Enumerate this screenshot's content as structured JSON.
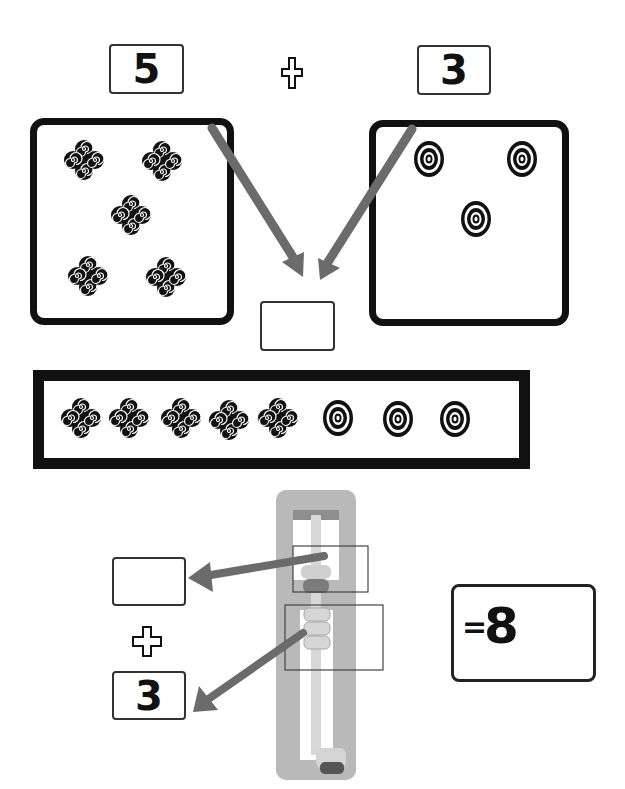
{
  "worksheet": {
    "heading_partial": "",
    "top_equation": {
      "left_number": "5",
      "operator": "plus",
      "right_number": "3"
    },
    "left_group": {
      "item_icon": "swirl-cluster-icon",
      "count": 5
    },
    "right_group": {
      "item_icon": "concentric-oval-icon",
      "count": 3
    },
    "combined_row": {
      "items": [
        "swirl-cluster-icon",
        "swirl-cluster-icon",
        "swirl-cluster-icon",
        "swirl-cluster-icon",
        "swirl-cluster-icon",
        "concentric-oval-icon",
        "concentric-oval-icon",
        "concentric-oval-icon"
      ]
    },
    "middle_answer": "",
    "abacus_section": {
      "top_answer": "",
      "operator": "plus",
      "bottom_number": "3",
      "result_equals": "=",
      "result_value": "8"
    },
    "colors": {
      "arrow": "#6b6b6b",
      "frame": "#111111",
      "abacus_body": "#b9b9b9",
      "abacus_bead": "#d6d6d6"
    }
  }
}
